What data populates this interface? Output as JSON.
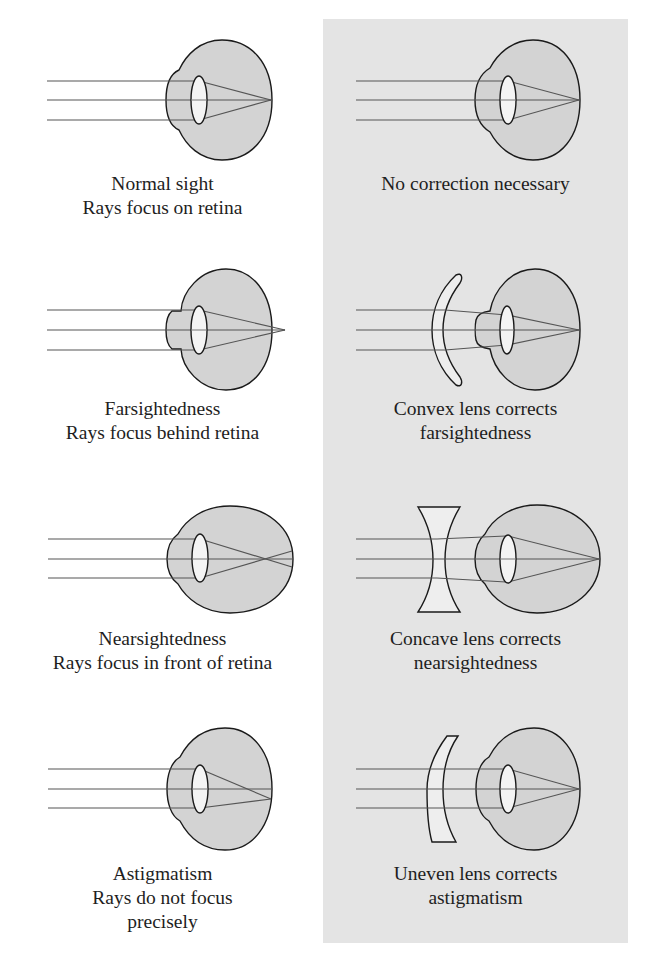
{
  "figure": {
    "colors": {
      "background": "#ffffff",
      "panel": "#e4e4e4",
      "eye_fill": "#d3d3d3",
      "lens_fill": "#f4f4f4",
      "corrective_lens_fill": "#eeeeee",
      "outline": "#1a1a1a",
      "ray": "#555555"
    },
    "left_column_title": "Vision condition",
    "right_column_title": "Correction",
    "rows": [
      {
        "id": "normal",
        "condition": {
          "lines": [
            "Normal sight",
            "Rays focus on retina"
          ]
        },
        "correction": {
          "lines": [
            "No correction necessary"
          ],
          "lens_type": "none"
        }
      },
      {
        "id": "farsighted",
        "condition": {
          "lines": [
            "Farsightedness",
            "Rays focus behind retina"
          ]
        },
        "correction": {
          "lines": [
            "Convex lens corrects",
            "farsightedness"
          ],
          "lens_type": "convex"
        }
      },
      {
        "id": "nearsighted",
        "condition": {
          "lines": [
            "Nearsightedness",
            "Rays focus in front of retina"
          ]
        },
        "correction": {
          "lines": [
            "Concave lens corrects",
            "nearsightedness"
          ],
          "lens_type": "concave"
        }
      },
      {
        "id": "astigmatism",
        "condition": {
          "lines": [
            "Astigmatism",
            "Rays do not focus",
            "precisely"
          ]
        },
        "correction": {
          "lines": [
            "Uneven lens corrects",
            "astigmatism"
          ],
          "lens_type": "uneven"
        }
      }
    ]
  }
}
